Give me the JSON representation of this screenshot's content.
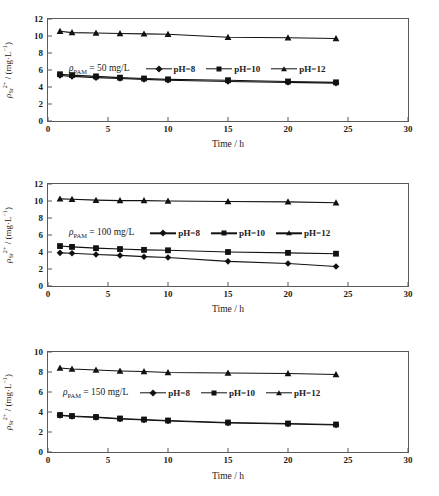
{
  "figure": {
    "axis": {
      "xlabel": "Time / h",
      "ylabel_var": "ρ",
      "ylabel_sub": "Sr",
      "ylabel_sup": "2+",
      "ylabel_units_open": " / (mg·L",
      "ylabel_units_sup": "−1",
      "ylabel_units_close": ")"
    },
    "legend": {
      "ph8": "pH=8",
      "ph10": "pH=10",
      "ph12": "pH=12"
    },
    "panels": [
      {
        "dose_var": "ρ",
        "dose_sub": "PAM",
        "dose_text": " = 50 mg/L",
        "yticks": [
          "0",
          "2",
          "4",
          "6",
          "8",
          "10",
          "12"
        ],
        "xticks": [
          "0",
          "5",
          "10",
          "15",
          "20",
          "25",
          "30"
        ]
      },
      {
        "dose_var": "ρ",
        "dose_sub": "PAM",
        "dose_text": " = 100 mg/L",
        "yticks": [
          "0",
          "2",
          "4",
          "6",
          "8",
          "10",
          "12"
        ],
        "xticks": [
          "0",
          "5",
          "10",
          "15",
          "20",
          "25",
          "30"
        ]
      },
      {
        "dose_var": "ρ",
        "dose_sub": "PAM",
        "dose_text": " = 150 mg/L",
        "yticks": [
          "0",
          "2",
          "4",
          "6",
          "8",
          "10"
        ],
        "xticks": [
          "0",
          "5",
          "10",
          "15",
          "20",
          "25",
          "30"
        ]
      }
    ]
  },
  "chart_data": [
    {
      "type": "line",
      "title": "ρ_PAM = 50 mg/L",
      "xlabel": "Time / h",
      "ylabel": "ρ_Sr2+ / (mg·L⁻¹)",
      "xlim": [
        0,
        30
      ],
      "ylim": [
        0,
        12
      ],
      "xticks": [
        0,
        5,
        10,
        15,
        20,
        25,
        30
      ],
      "yticks": [
        0,
        2,
        4,
        6,
        8,
        10,
        12
      ],
      "grid": false,
      "legend_position": "inside-upper-right",
      "x": [
        1,
        2,
        4,
        6,
        8,
        10,
        15,
        20,
        24
      ],
      "series": [
        {
          "name": "pH=8",
          "marker": "diamond",
          "values": [
            5.35,
            5.25,
            5.1,
            5.0,
            4.9,
            4.8,
            4.65,
            4.55,
            4.45
          ]
        },
        {
          "name": "pH=10",
          "marker": "square",
          "values": [
            5.5,
            5.4,
            5.25,
            5.1,
            5.0,
            4.9,
            4.8,
            4.65,
            4.55
          ]
        },
        {
          "name": "pH=12",
          "marker": "triangle",
          "values": [
            10.55,
            10.4,
            10.35,
            10.3,
            10.25,
            10.2,
            9.85,
            9.8,
            9.7
          ]
        }
      ]
    },
    {
      "type": "line",
      "title": "ρ_PAM = 100 mg/L",
      "xlabel": "Time / h",
      "ylabel": "ρ_Sr2+ / (mg·L⁻¹)",
      "xlim": [
        0,
        30
      ],
      "ylim": [
        0,
        12
      ],
      "xticks": [
        0,
        5,
        10,
        15,
        20,
        25,
        30
      ],
      "yticks": [
        0,
        2,
        4,
        6,
        8,
        10,
        12
      ],
      "grid": false,
      "legend_position": "inside-upper-right",
      "x": [
        1,
        2,
        4,
        6,
        8,
        10,
        15,
        20,
        24
      ],
      "series": [
        {
          "name": "pH=8",
          "marker": "diamond",
          "values": [
            3.9,
            3.85,
            3.7,
            3.6,
            3.45,
            3.35,
            2.9,
            2.65,
            2.3
          ]
        },
        {
          "name": "pH=10",
          "marker": "square",
          "values": [
            4.7,
            4.6,
            4.45,
            4.35,
            4.25,
            4.2,
            4.0,
            3.9,
            3.8
          ]
        },
        {
          "name": "pH=12",
          "marker": "triangle",
          "values": [
            10.25,
            10.2,
            10.1,
            10.05,
            10.05,
            10.0,
            9.95,
            9.9,
            9.8
          ]
        }
      ]
    },
    {
      "type": "line",
      "title": "ρ_PAM = 150 mg/L",
      "xlabel": "Time / h",
      "ylabel": "ρ_Sr2+ / (mg·L⁻¹)",
      "xlim": [
        0,
        30
      ],
      "ylim": [
        0,
        10
      ],
      "xticks": [
        0,
        5,
        10,
        15,
        20,
        25,
        30
      ],
      "yticks": [
        0,
        2,
        4,
        6,
        8,
        10
      ],
      "grid": false,
      "legend_position": "inside-middle",
      "x": [
        1,
        2,
        4,
        6,
        8,
        10,
        15,
        20,
        24
      ],
      "series": [
        {
          "name": "pH=8",
          "marker": "diamond",
          "values": [
            3.65,
            3.55,
            3.45,
            3.3,
            3.2,
            3.1,
            2.9,
            2.8,
            2.7
          ]
        },
        {
          "name": "pH=10",
          "marker": "square",
          "values": [
            3.7,
            3.6,
            3.5,
            3.35,
            3.25,
            3.15,
            2.95,
            2.85,
            2.75
          ]
        },
        {
          "name": "pH=12",
          "marker": "triangle",
          "values": [
            8.4,
            8.3,
            8.2,
            8.1,
            8.05,
            7.95,
            7.9,
            7.85,
            7.75
          ]
        }
      ]
    }
  ]
}
